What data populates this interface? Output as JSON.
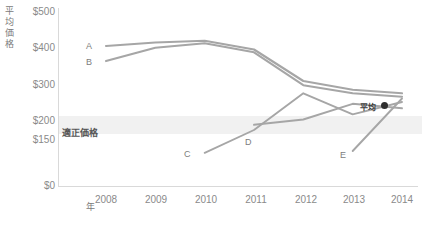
{
  "chart_data": {
    "type": "line",
    "title": "",
    "xlabel": "年",
    "ylabel": "平均価格",
    "x": [
      2008,
      2009,
      2010,
      2011,
      2012,
      2013,
      2014
    ],
    "xticklabels": [
      "2008",
      "2009",
      "2010",
      "2011",
      "2012",
      "2013",
      "2014"
    ],
    "yticklabels": [
      "$500",
      "$400",
      "$300",
      "$200",
      "$150",
      "$0"
    ],
    "ytickvalues": [
      500,
      400,
      300,
      200,
      150,
      0
    ],
    "ylim": [
      0,
      500
    ],
    "grid": false,
    "legend_position": "inline-labels",
    "band": {
      "label": "適正価格",
      "from": 150,
      "to": 200,
      "color": "#f1f1f1"
    },
    "annotations": [
      {
        "text": "平均",
        "x": 2014,
        "y": 225,
        "marker": "filled-circle",
        "color": "#2e2e2e"
      }
    ],
    "series": [
      {
        "name": "A",
        "label": "A",
        "color": "#a6a6a6",
        "values": [
          400,
          410,
          415,
          390,
          300,
          275,
          265
        ]
      },
      {
        "name": "B",
        "label": "B",
        "color": "#a6a6a6",
        "values": [
          357,
          395,
          408,
          382,
          288,
          265,
          255
        ]
      },
      {
        "name": "C",
        "label": "C",
        "color": "#a6a6a6",
        "values": [
          null,
          null,
          95,
          160,
          265,
          205,
          240
        ]
      },
      {
        "name": "D",
        "label": "D",
        "color": "#a6a6a6",
        "values": [
          null,
          null,
          null,
          175,
          190,
          235,
          222
        ]
      },
      {
        "name": "E",
        "label": "E",
        "color": "#a6a6a6",
        "values": [
          null,
          null,
          null,
          null,
          null,
          100,
          250
        ]
      }
    ]
  },
  "axes": {
    "y_title": "平均価格",
    "x_title": "年",
    "yticks": [
      {
        "label": "$500"
      },
      {
        "label": "$400"
      },
      {
        "label": "$300"
      },
      {
        "label": "$200"
      },
      {
        "label": "$150"
      },
      {
        "label": "$0"
      }
    ],
    "xticks": [
      {
        "label": "2008"
      },
      {
        "label": "2009"
      },
      {
        "label": "2010"
      },
      {
        "label": "2011"
      },
      {
        "label": "2012"
      },
      {
        "label": "2013"
      },
      {
        "label": "2014"
      }
    ]
  },
  "labels": {
    "a": "A",
    "b": "B",
    "c": "C",
    "d": "D",
    "e": "E",
    "band": "適正価格",
    "average": "平均"
  }
}
